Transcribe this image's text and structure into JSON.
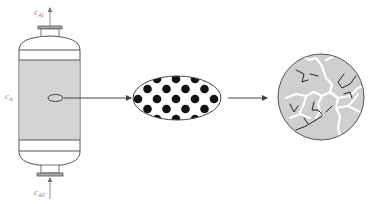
{
  "diagram": {
    "title": "",
    "colors": {
      "stroke": "#555555",
      "vessel_fill": "#d4d4d4",
      "pellet_dot": "#111111",
      "particle_fill": "#cfcfcf",
      "crack": "#ffffff",
      "label": "#8a8a8a"
    },
    "labels": {
      "outlet": {
        "base": "c",
        "sub": "Af"
      },
      "bulk": {
        "base": "c",
        "sub": "A"
      },
      "inlet": {
        "base": "c",
        "sub": "A0"
      }
    },
    "stages": [
      {
        "name": "packed-bed-reactor",
        "description": "Vertical reactor vessel with catalyst bed"
      },
      {
        "name": "catalyst-pellet",
        "description": "Elliptical pellet containing dispersed particles"
      },
      {
        "name": "porous-particle",
        "description": "Magnified particle showing pore network"
      }
    ],
    "arrows": [
      {
        "from": "packed-bed-reactor",
        "to": "catalyst-pellet"
      },
      {
        "from": "catalyst-pellet",
        "to": "porous-particle"
      }
    ]
  }
}
